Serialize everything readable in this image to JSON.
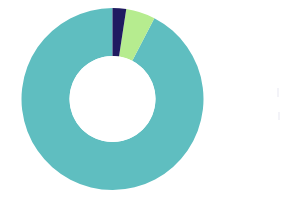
{
  "chart_data": {
    "type": "pie",
    "variant": "donut",
    "title": "",
    "subtitle": "",
    "xlabel": "",
    "ylabel": "",
    "grid": false,
    "legend_position": "none",
    "labels_shown": false,
    "start_angle_deg": 0,
    "direction": "counterclockwise",
    "center": {
      "x": 112.5,
      "y": 99
    },
    "outer_radius": 91,
    "inner_radius": 43,
    "categories": [
      "Segment 1",
      "Segment 2",
      "Segment 3"
    ],
    "values": [
      92.4,
      5.2,
      2.4
    ],
    "units": "percent",
    "colors": [
      "#5fbec0",
      "#b6ec8f",
      "#201b60"
    ],
    "slices": [
      {
        "name": "Segment 1",
        "value": 92.4,
        "color": "#5fbec0",
        "start_angle_deg": 0,
        "end_angle_deg": 332.6,
        "label": ""
      },
      {
        "name": "Segment 2",
        "value": 5.2,
        "color": "#b6ec8f",
        "start_angle_deg": 332.6,
        "end_angle_deg": 351.3,
        "label": ""
      },
      {
        "name": "Segment 3",
        "value": 2.4,
        "color": "#201b60",
        "start_angle_deg": 351.3,
        "end_angle_deg": 360,
        "label": ""
      }
    ]
  },
  "palette": {
    "teal": "#5fbec0",
    "light_green": "#b6ec8f",
    "navy": "#201b60",
    "background": "#ffffff",
    "hole": "#ffffff"
  }
}
